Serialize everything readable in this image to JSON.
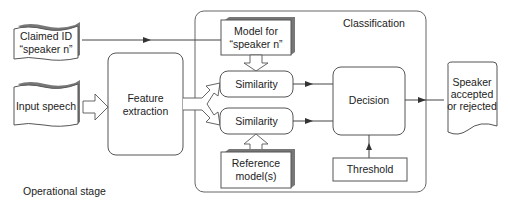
{
  "diagram": {
    "title": "Operational stage",
    "group_label": "Classification",
    "inputs": {
      "claimed_id": [
        "Claimed ID",
        "“speaker n”"
      ],
      "input_speech": [
        "Input speech"
      ]
    },
    "blocks": {
      "feature_extraction": [
        "Feature",
        "extraction"
      ],
      "model_for_speaker": [
        "Model for",
        "“speaker n”"
      ],
      "similarity_top": [
        "Similarity"
      ],
      "similarity_bottom": [
        "Similarity"
      ],
      "reference_models": [
        "Reference",
        "model(s)"
      ],
      "decision": [
        "Decision"
      ],
      "threshold": [
        "Threshold"
      ]
    },
    "output": [
      "Speaker",
      "accepted",
      "or rejected"
    ],
    "colors": {
      "stroke": "#555555",
      "shadow": "#777777",
      "text": "#222222",
      "background": "#ffffff"
    }
  }
}
